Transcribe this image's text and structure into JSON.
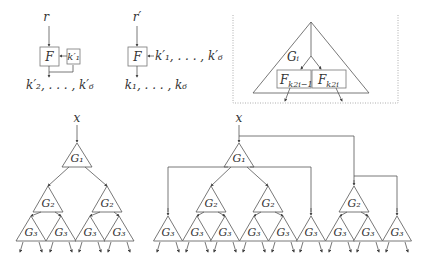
{
  "panel_a": {
    "input_label": "r",
    "box_label": "F",
    "key_box_label": "k′₁",
    "output_label": "k′₂, . . . , k′₆"
  },
  "panel_b": {
    "input_label": "r′",
    "box_label": "F",
    "key_label": "k′₁, . . . , k′₆",
    "output_label": "k₁, . . . , k₆"
  },
  "panel_c": {
    "triangle_label": "Gᵢ",
    "left_box_label": "F",
    "left_box_sub": "k2i−1",
    "right_box_label": "F",
    "right_box_sub": "k2i"
  },
  "tree_left": {
    "input_label": "x",
    "level1": [
      "G₁"
    ],
    "level2": [
      "G₂",
      "G₂"
    ],
    "level3": [
      "G₃",
      "G₃",
      "G₃",
      "G₃"
    ]
  },
  "tree_right": {
    "input_label": "x",
    "level1": [
      "G₁"
    ],
    "level2": [
      "G₂",
      "G₂",
      "G₂"
    ],
    "level3": [
      "G₃",
      "G₃",
      "G₃",
      "G₃",
      "G₃",
      "G₃",
      "G₃",
      "G₃",
      "G₃"
    ]
  }
}
